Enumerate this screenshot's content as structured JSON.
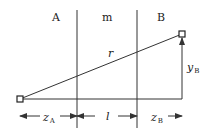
{
  "regions": [
    {
      "id": "A",
      "label": "A"
    },
    {
      "id": "m",
      "label": "m"
    },
    {
      "id": "B",
      "label": "B"
    }
  ],
  "labels": {
    "r": "r",
    "yB_main": "y",
    "yB_sub": "B",
    "zA_main": "z",
    "zA_sub": "A",
    "l": "l",
    "zB_main": "z",
    "zB_sub": "B"
  },
  "colors": {
    "line": "#333333",
    "background": "#ffffff"
  }
}
